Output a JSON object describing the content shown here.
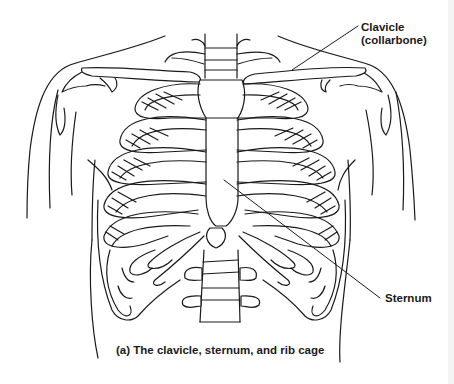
{
  "figure": {
    "caption": "(a) The clavicle, sternum, and rib cage",
    "labels": {
      "clavicle_line1": "Clavicle",
      "clavicle_line2": "(collarbone)",
      "sternum": "Sternum"
    },
    "colors": {
      "line": "#1a1a1a",
      "background": "#ffffff"
    }
  }
}
